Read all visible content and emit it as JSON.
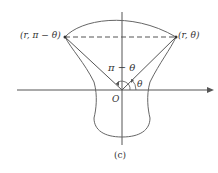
{
  "diagram": {
    "point_left_label": "(r, π − θ)",
    "point_right_label": "(r, θ)",
    "angle_obtuse_label": "π − θ",
    "angle_acute_label": "θ",
    "origin_label": "O",
    "caption": "(c)"
  },
  "colors": {
    "stroke": "#555555",
    "text": "#333333",
    "background": "#ffffff"
  }
}
